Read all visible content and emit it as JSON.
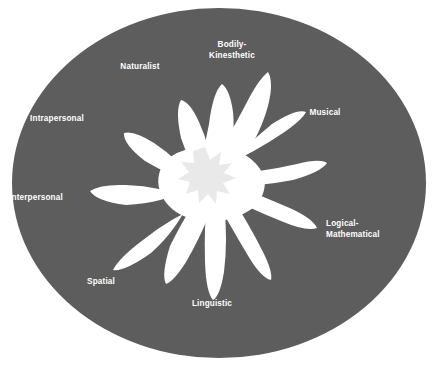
{
  "diagram": {
    "type": "multiple-intelligences-flower",
    "background_color": "#ffffff",
    "ellipse_color": "#5d5d5d",
    "petal_color": "#ffffff",
    "center_color": "#e9e9e9",
    "label_color": "#ffffff",
    "labels": [
      {
        "id": "bodily-kinesthetic",
        "text": "Bodily-\nKinesthetic",
        "x": 232,
        "y": 46,
        "align": "center"
      },
      {
        "id": "naturalist",
        "text": "Naturalist",
        "x": 140,
        "y": 66,
        "align": "center"
      },
      {
        "id": "musical",
        "text": "Musical",
        "x": 325,
        "y": 112,
        "align": "center"
      },
      {
        "id": "intrapersonal",
        "text": "Intrapersonal",
        "x": 55,
        "y": 118,
        "align": "center"
      },
      {
        "id": "interpersonal",
        "text": "Interpersonal",
        "x": 31,
        "y": 197,
        "align": "center"
      },
      {
        "id": "logical-mathematical",
        "text": "Logical-\nMathematical",
        "x": 326,
        "y": 225,
        "align": "left"
      },
      {
        "id": "spatial",
        "text": "Spatial",
        "x": 99,
        "y": 281,
        "align": "center"
      },
      {
        "id": "linguistic",
        "text": "Linguistic",
        "x": 210,
        "y": 303,
        "align": "center"
      }
    ]
  }
}
